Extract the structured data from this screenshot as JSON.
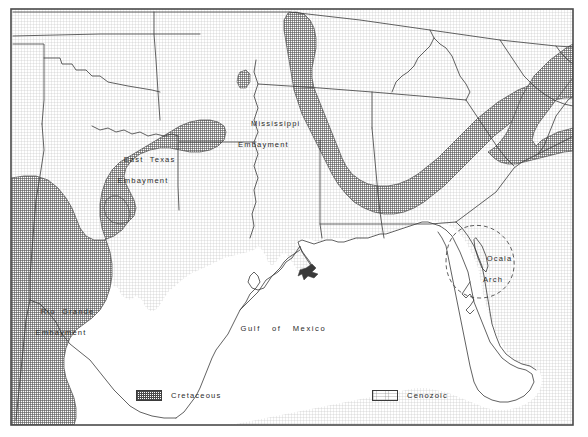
{
  "figure": {
    "frame_color": "#4a4a4a",
    "background_color": "#ffffff",
    "line_color": "#3a3a3a"
  },
  "map": {
    "labels": {
      "east_texas": {
        "line1": "East  Texas",
        "line2": "Embayment"
      },
      "mississippi": {
        "line1": "Mississippi",
        "line2": "Embayment"
      },
      "rio_grande": {
        "line1": "Rio  Grande",
        "line2": "Embayment"
      },
      "ocala": {
        "line1": "Ocala",
        "line2": "Arch"
      },
      "gulf": {
        "line1": "Gulf   of   Mexico"
      }
    }
  },
  "legend": {
    "items": [
      {
        "label": "Cretaceous",
        "pattern": "stipple-dense",
        "swatch_color": "#4a4a4a"
      },
      {
        "label": "Cenozoic",
        "pattern": "stipple-light",
        "swatch_color": "#ffffff"
      }
    ]
  }
}
